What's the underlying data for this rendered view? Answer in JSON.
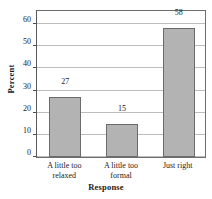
{
  "chart_data": {
    "type": "bar",
    "title": "",
    "xlabel": "Response",
    "ylabel": "Percent",
    "categories": [
      "A little too relaxed",
      "A little too formal",
      "Just right"
    ],
    "category_lines": [
      [
        "A little too",
        "relaxed"
      ],
      [
        "A little too",
        "formal"
      ],
      [
        "Just right",
        ""
      ]
    ],
    "values": [
      27,
      15,
      58
    ],
    "value_labels": [
      "27",
      "15",
      "58"
    ],
    "ylim": [
      0,
      60
    ],
    "yticks": [
      0,
      10,
      20,
      30,
      40,
      50,
      60
    ],
    "ytick_labels": [
      "0",
      "10",
      "20",
      "30",
      "40",
      "50",
      "60"
    ],
    "grid": true,
    "legend": null,
    "colors": {
      "bar_fill": "#b3b3b3",
      "bar_edge": "#6b6b6b",
      "gridline": "#bdbdbd",
      "frame": "#6e6e6e",
      "text": "#1a1a1a",
      "background": "#ffffff"
    }
  }
}
